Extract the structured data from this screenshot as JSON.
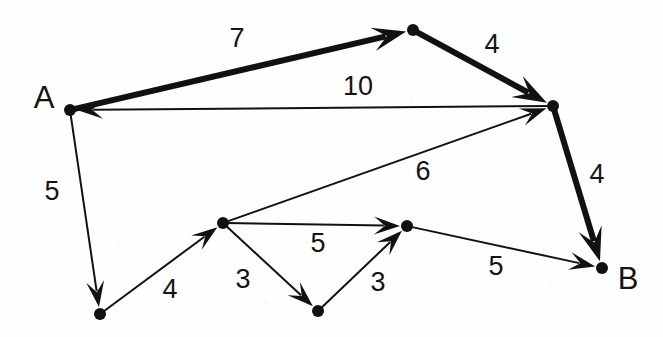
{
  "figure": {
    "type": "directed-weighted-graph-diagram",
    "background_color": "#ffffff",
    "ink_color": "#111111",
    "width": 663,
    "height": 337
  },
  "chart_data": {
    "type": "diagram",
    "title": "",
    "nodes": [
      {
        "id": "A",
        "label": "A",
        "x": 70,
        "y": 110,
        "label_x": 44,
        "label_y": 100,
        "radius": 6
      },
      {
        "id": "n2",
        "label": "",
        "x": 413,
        "y": 30,
        "radius": 6
      },
      {
        "id": "n3",
        "label": "",
        "x": 553,
        "y": 106,
        "radius": 6
      },
      {
        "id": "B",
        "label": "B",
        "x": 602,
        "y": 268,
        "label_x": 628,
        "label_y": 281,
        "radius": 6
      },
      {
        "id": "n5",
        "label": "",
        "x": 100,
        "y": 314,
        "radius": 6
      },
      {
        "id": "n6",
        "label": "",
        "x": 223,
        "y": 223,
        "radius": 6
      },
      {
        "id": "n7",
        "label": "",
        "x": 318,
        "y": 311,
        "radius": 6
      },
      {
        "id": "n8",
        "label": "",
        "x": 407,
        "y": 226,
        "radius": 6
      }
    ],
    "edges": [
      {
        "from": "A",
        "to": "n2",
        "weight": "7",
        "label_x": 237,
        "label_y": 40,
        "stroke": 6,
        "directed": true
      },
      {
        "from": "n2",
        "to": "n3",
        "weight": "4",
        "label_x": 492,
        "label_y": 46,
        "stroke": 6,
        "directed": true
      },
      {
        "from": "n3",
        "to": "A",
        "weight": "10",
        "label_x": 358,
        "label_y": 88,
        "stroke": 2,
        "directed": true
      },
      {
        "from": "n3",
        "to": "B",
        "weight": "4",
        "label_x": 597,
        "label_y": 176,
        "stroke": 6,
        "directed": true
      },
      {
        "from": "A",
        "to": "n5",
        "weight": "5",
        "label_x": 52,
        "label_y": 193,
        "stroke": 2,
        "directed": true
      },
      {
        "from": "n5",
        "to": "n6",
        "weight": "4",
        "label_x": 170,
        "label_y": 291,
        "stroke": 2,
        "directed": true
      },
      {
        "from": "n6",
        "to": "n3",
        "weight": "6",
        "label_x": 423,
        "label_y": 173,
        "stroke": 2,
        "directed": true
      },
      {
        "from": "n6",
        "to": "n8",
        "weight": "5",
        "label_x": 318,
        "label_y": 245,
        "stroke": 2,
        "directed": true
      },
      {
        "from": "n6",
        "to": "n7",
        "weight": "3",
        "label_x": 243,
        "label_y": 281,
        "stroke": 2,
        "directed": true
      },
      {
        "from": "n7",
        "to": "n8",
        "weight": "3",
        "label_x": 378,
        "label_y": 284,
        "stroke": 2,
        "directed": true
      },
      {
        "from": "n8",
        "to": "B",
        "weight": "5",
        "label_x": 496,
        "label_y": 268,
        "stroke": 2,
        "directed": true
      }
    ],
    "weights": [
      "7",
      "4",
      "10",
      "4",
      "5",
      "4",
      "6",
      "5",
      "3",
      "3",
      "5"
    ],
    "node_labels": [
      "A",
      "B"
    ],
    "xlabel": "",
    "ylabel": "",
    "legend": [],
    "grid": false
  }
}
